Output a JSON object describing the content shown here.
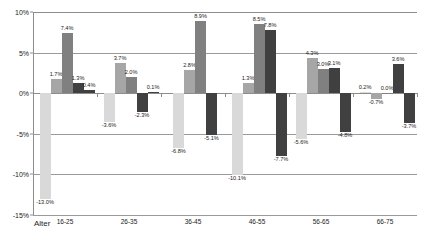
{
  "chart_data": {
    "type": "bar",
    "title": "",
    "subtitle": "",
    "xlabel": "Alter",
    "ylabel": "",
    "categories": [
      "16-25",
      "26-35",
      "36-45",
      "46-55",
      "56-65",
      "66-75"
    ],
    "ylim": [
      -15,
      10
    ],
    "ytick_labels": [
      "10%",
      "5%",
      "0%",
      "-5%",
      "-10%",
      "-15%"
    ],
    "ytick_values": [
      10,
      5,
      0,
      -5,
      -10,
      -15
    ],
    "grid": true,
    "legend": "none",
    "series": [
      {
        "name": "series-1",
        "color": "#d9d9d9",
        "values": [
          -13.0,
          -3.6,
          -6.8,
          -10.1,
          -5.6,
          0.2
        ],
        "labels": [
          "-13.0%",
          "-3.6%",
          "-6.8%",
          "-10.1%",
          "-5.6%",
          "0.2%"
        ]
      },
      {
        "name": "series-2",
        "color": "#a6a6a6",
        "values": [
          1.7,
          3.7,
          2.8,
          1.3,
          4.3,
          -0.7
        ],
        "labels": [
          "1.7%",
          "3.7%",
          "2.8%",
          "1.3%",
          "4.3%",
          "-0.7%"
        ]
      },
      {
        "name": "series-3",
        "color": "#808080",
        "values": [
          7.4,
          2.0,
          8.9,
          8.5,
          3.0,
          0.0
        ],
        "labels": [
          "7.4%",
          "2.0%",
          "8.9%",
          "8.5%",
          "3.0%",
          "0.0%"
        ]
      },
      {
        "name": "series-4",
        "color": "#404040",
        "values": [
          1.3,
          -2.3,
          -5.1,
          7.8,
          3.1,
          3.6
        ],
        "labels": [
          "1.3%",
          "-2.3%",
          "-5.1%",
          "7.8%",
          "3.1%",
          "3.6%"
        ]
      },
      {
        "name": "series-5",
        "color": "#404040",
        "values": [
          0.4,
          0.1,
          null,
          -7.7,
          -4.8,
          -3.7
        ],
        "labels": [
          "0.4%",
          "0.1%",
          "",
          "-7.7%",
          "-4.8%",
          "-3.7%"
        ]
      }
    ]
  }
}
